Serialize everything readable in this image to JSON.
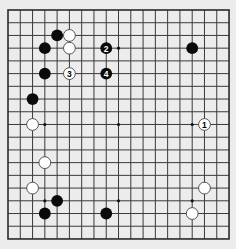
{
  "board": {
    "size": 19,
    "origin_x": 8,
    "origin_y": 10,
    "spacing_x": 12.28,
    "spacing_y": 12.72,
    "stone_radius": 5.9,
    "colors": {
      "background": "#ececec",
      "grid": "#3a3a3a",
      "black_stone": "#0a0a0a",
      "white_stone": "#ffffff"
    },
    "star_points": [
      [
        3,
        3
      ],
      [
        9,
        3
      ],
      [
        15,
        3
      ],
      [
        3,
        9
      ],
      [
        9,
        9
      ],
      [
        15,
        9
      ],
      [
        3,
        15
      ],
      [
        9,
        15
      ],
      [
        15,
        15
      ]
    ],
    "stones": [
      {
        "color": "black",
        "col": 4,
        "row": 2,
        "label": ""
      },
      {
        "color": "white",
        "col": 5,
        "row": 2,
        "label": ""
      },
      {
        "color": "black",
        "col": 3,
        "row": 3,
        "label": ""
      },
      {
        "color": "white",
        "col": 5,
        "row": 3,
        "label": ""
      },
      {
        "color": "black",
        "col": 8,
        "row": 3,
        "label": "2"
      },
      {
        "color": "black",
        "col": 15,
        "row": 3,
        "label": ""
      },
      {
        "color": "black",
        "col": 3,
        "row": 5,
        "label": ""
      },
      {
        "color": "white",
        "col": 5,
        "row": 5,
        "label": "3"
      },
      {
        "color": "black",
        "col": 8,
        "row": 5,
        "label": "4"
      },
      {
        "color": "black",
        "col": 2,
        "row": 7,
        "label": ""
      },
      {
        "color": "white",
        "col": 2,
        "row": 9,
        "label": ""
      },
      {
        "color": "white",
        "col": 16,
        "row": 9,
        "label": "1"
      },
      {
        "color": "white",
        "col": 3,
        "row": 12,
        "label": ""
      },
      {
        "color": "white",
        "col": 2,
        "row": 14,
        "label": ""
      },
      {
        "color": "white",
        "col": 16,
        "row": 14,
        "label": ""
      },
      {
        "color": "black",
        "col": 4,
        "row": 15,
        "label": ""
      },
      {
        "color": "black",
        "col": 3,
        "row": 16,
        "label": ""
      },
      {
        "color": "black",
        "col": 8,
        "row": 16,
        "label": ""
      },
      {
        "color": "white",
        "col": 15,
        "row": 16,
        "label": ""
      }
    ]
  }
}
